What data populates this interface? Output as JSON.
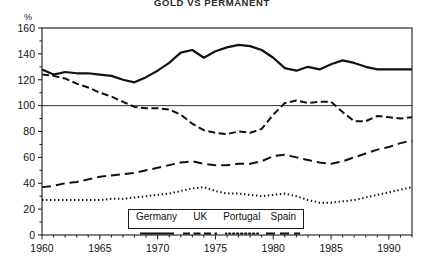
{
  "chart_data": {
    "type": "line",
    "title": "GOLD VS PERMANENT",
    "ylabel": "%",
    "xlabel": "",
    "ylim": [
      0,
      160
    ],
    "xlim": [
      1960,
      1992
    ],
    "yticks": [
      0,
      20,
      40,
      60,
      80,
      100,
      120,
      140,
      160
    ],
    "xticks": [
      1960,
      1965,
      1970,
      1975,
      1980,
      1985,
      1990
    ],
    "xtick_minor_step": 1,
    "grid": false,
    "reference_line": 100,
    "legend_position": "bottom-center",
    "x": [
      1960,
      1961,
      1962,
      1963,
      1964,
      1965,
      1966,
      1967,
      1968,
      1969,
      1970,
      1971,
      1972,
      1973,
      1974,
      1975,
      1976,
      1977,
      1978,
      1979,
      1980,
      1981,
      1982,
      1983,
      1984,
      1985,
      1986,
      1987,
      1988,
      1989,
      1990,
      1991,
      1992
    ],
    "series": [
      {
        "name": "Germany",
        "style": "solid",
        "color": "#111111",
        "width": 2.2,
        "values": [
          128,
          124,
          126,
          125,
          125,
          124,
          123,
          120,
          118,
          122,
          127,
          133,
          141,
          143,
          137,
          142,
          145,
          147,
          146,
          143,
          137,
          129,
          127,
          130,
          128,
          132,
          135,
          133,
          130,
          128,
          128,
          128,
          128
        ]
      },
      {
        "name": "UK",
        "style": "dashed",
        "color": "#111111",
        "width": 2.0,
        "values": [
          124,
          123,
          121,
          117,
          114,
          110,
          107,
          103,
          99,
          98,
          98,
          97,
          93,
          86,
          81,
          79,
          78,
          80,
          79,
          82,
          93,
          102,
          104,
          102,
          103,
          103,
          95,
          88,
          88,
          92,
          91,
          90,
          91
        ]
      },
      {
        "name": "Portugal",
        "style": "dotted",
        "color": "#111111",
        "width": 2.0,
        "values": [
          27,
          27,
          27,
          27,
          27,
          27,
          28,
          28,
          29,
          30,
          31,
          32,
          34,
          36,
          37,
          34,
          32,
          32,
          31,
          30,
          31,
          32,
          30,
          27,
          25,
          25,
          26,
          27,
          29,
          31,
          33,
          35,
          37
        ]
      },
      {
        "name": "Spain",
        "style": "longdash",
        "color": "#111111",
        "width": 2.0,
        "values": [
          37,
          38,
          40,
          41,
          43,
          45,
          46,
          47,
          48,
          50,
          52,
          54,
          56,
          57,
          55,
          54,
          54,
          55,
          55,
          57,
          61,
          62,
          60,
          58,
          56,
          55,
          57,
          60,
          63,
          66,
          68,
          71,
          73
        ]
      }
    ]
  },
  "legend": {
    "items": [
      {
        "label": "Germany"
      },
      {
        "label": "UK"
      },
      {
        "label": "Portugal"
      },
      {
        "label": "Spain"
      }
    ]
  }
}
